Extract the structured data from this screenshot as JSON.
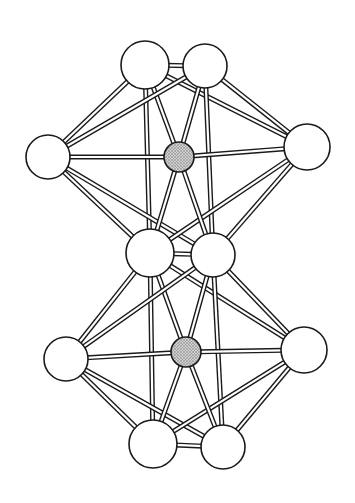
{
  "diagram": {
    "type": "ball-and-stick cluster structure",
    "colors": {
      "background": "#ffffff",
      "outline": "#1a1a1a",
      "atom_fill": "#ffffff",
      "center_fill": "#bdbdbd"
    },
    "atoms": [
      {
        "id": "a1",
        "x": 145,
        "y": 65,
        "r": 24,
        "kind": "outer"
      },
      {
        "id": "a2",
        "x": 205,
        "y": 66,
        "r": 22,
        "kind": "outer"
      },
      {
        "id": "a3",
        "x": 48,
        "y": 157,
        "r": 22,
        "kind": "outer"
      },
      {
        "id": "a4",
        "x": 307,
        "y": 147,
        "r": 23,
        "kind": "outer"
      },
      {
        "id": "c1",
        "x": 179,
        "y": 157,
        "r": 15,
        "kind": "center"
      },
      {
        "id": "a5",
        "x": 150,
        "y": 253,
        "r": 24,
        "kind": "outer"
      },
      {
        "id": "a6",
        "x": 213,
        "y": 255,
        "r": 22,
        "kind": "outer"
      },
      {
        "id": "a7",
        "x": 66,
        "y": 359,
        "r": 22,
        "kind": "outer"
      },
      {
        "id": "a8",
        "x": 304,
        "y": 350,
        "r": 23,
        "kind": "outer"
      },
      {
        "id": "c2",
        "x": 186,
        "y": 352,
        "r": 15,
        "kind": "center"
      },
      {
        "id": "a9",
        "x": 153,
        "y": 444,
        "r": 24,
        "kind": "outer"
      },
      {
        "id": "a10",
        "x": 223,
        "y": 447,
        "r": 22,
        "kind": "outer"
      }
    ],
    "bonds": [
      [
        "a1",
        "a2"
      ],
      [
        "a1",
        "a3"
      ],
      [
        "a1",
        "a4"
      ],
      [
        "a1",
        "c1"
      ],
      [
        "a1",
        "a5"
      ],
      [
        "a2",
        "a3"
      ],
      [
        "a2",
        "a4"
      ],
      [
        "a2",
        "c1"
      ],
      [
        "a2",
        "a6"
      ],
      [
        "a3",
        "c1"
      ],
      [
        "a3",
        "a5"
      ],
      [
        "a3",
        "a6"
      ],
      [
        "a4",
        "c1"
      ],
      [
        "a4",
        "a5"
      ],
      [
        "a4",
        "a6"
      ],
      [
        "c1",
        "a5"
      ],
      [
        "c1",
        "a6"
      ],
      [
        "a5",
        "a6"
      ],
      [
        "a5",
        "a7"
      ],
      [
        "a5",
        "a8"
      ],
      [
        "a5",
        "c2"
      ],
      [
        "a5",
        "a9"
      ],
      [
        "a6",
        "a7"
      ],
      [
        "a6",
        "a8"
      ],
      [
        "a6",
        "c2"
      ],
      [
        "a6",
        "a10"
      ],
      [
        "a7",
        "c2"
      ],
      [
        "a7",
        "a9"
      ],
      [
        "a7",
        "a10"
      ],
      [
        "a8",
        "c2"
      ],
      [
        "a8",
        "a9"
      ],
      [
        "a8",
        "a10"
      ],
      [
        "c2",
        "a9"
      ],
      [
        "c2",
        "a10"
      ],
      [
        "a9",
        "a10"
      ]
    ]
  }
}
